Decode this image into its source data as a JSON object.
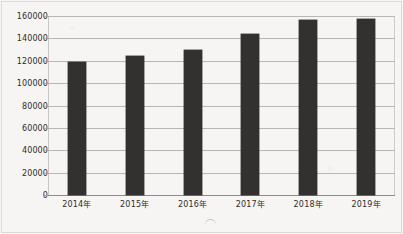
{
  "chart_data": {
    "type": "bar",
    "title": "",
    "subtitle": "",
    "xlabel": "",
    "ylabel": "",
    "categories": [
      "2014年",
      "2015年",
      "2016年",
      "2017年",
      "2018年",
      "2019年"
    ],
    "values": [
      119000,
      124000,
      130000,
      144000,
      156000,
      157000
    ],
    "series": [
      {
        "name": "",
        "values": [
          119000,
          124000,
          130000,
          144000,
          156000,
          157000
        ]
      }
    ],
    "ylim": [
      0,
      160000
    ],
    "ytick_labels": [
      "0",
      "20000",
      "40000",
      "60000",
      "80000",
      "100000",
      "120000",
      "140000",
      "160000"
    ],
    "ytick_values": [
      0,
      20000,
      40000,
      60000,
      80000,
      100000,
      120000,
      140000,
      160000
    ],
    "grid": true,
    "legend": false,
    "legend_position": "none",
    "bar_color": "#333130",
    "gridline_color": "#b9b7b3",
    "background_color": "#f6f5f3",
    "text_color": "#2e2c2a"
  }
}
